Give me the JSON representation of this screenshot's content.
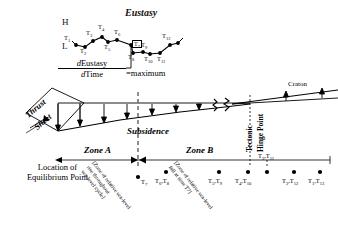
{
  "eustasy": {
    "title": "Eustasy",
    "high_label": "H",
    "low_label": "L",
    "formula_numerator": "dEustasy",
    "formula_denominator": "dTime",
    "formula_result": "=maximum",
    "boxed_point": "T7",
    "points": [
      {
        "label": "T1",
        "x": 76,
        "y": 45,
        "lx": 66,
        "ly": 39
      },
      {
        "label": "T2",
        "x": 85,
        "y": 47,
        "lx": 81,
        "ly": 50
      },
      {
        "label": "T3",
        "x": 93,
        "y": 41,
        "lx": 87,
        "ly": 34
      },
      {
        "label": "T4",
        "x": 102,
        "y": 37,
        "lx": 99,
        "ly": 28
      },
      {
        "label": "T5",
        "x": 108,
        "y": 42,
        "lx": 104,
        "ly": 48
      },
      {
        "label": "T6",
        "x": 117,
        "y": 40,
        "lx": 114,
        "ly": 33
      },
      {
        "label": "T7",
        "x": 131,
        "y": 45,
        "lx": 133,
        "ly": 35
      },
      {
        "label": "T8",
        "x": 133,
        "y": 53,
        "lx": 130,
        "ly": 57
      },
      {
        "label": "T9",
        "x": 143,
        "y": 52,
        "lx": 141,
        "ly": 45
      },
      {
        "label": "T10",
        "x": 150,
        "y": 54,
        "lx": 144,
        "ly": 58
      },
      {
        "label": "T11",
        "x": 160,
        "y": 53,
        "lx": 157,
        "ly": 58
      },
      {
        "label": "T12",
        "x": 170,
        "y": 45,
        "lx": 163,
        "ly": 38
      },
      {
        "label": "T13",
        "x": 178,
        "y": 43,
        "lx": 176,
        "ly": 36
      }
    ]
  },
  "cross_section": {
    "thrust_sheet_line1": "Thrust",
    "thrust_sheet_line2": "Sheet",
    "subsidence_label": "Subsidence",
    "craton_label": "Craton",
    "hinge_line1": "Tectonic",
    "hinge_line2": "Hinge Point"
  },
  "zones": {
    "zone_a": "Zone A",
    "zone_b": "Zone B",
    "note_a": "[Zone of relative sea-level rise throughout sea-level cycle]",
    "note_a_lines": [
      "[Zone of relative sea-level",
      "rise throughout",
      "sea-level cycle]"
    ],
    "note_b_lines": [
      "[Zone of relative sea-level",
      "fall at time T7]"
    ]
  },
  "equilibrium": {
    "line1": "Location of",
    "line2": "Equilibrium Point"
  },
  "bottom_points": [
    {
      "label": "T7",
      "sub1": "7",
      "x": 138,
      "y": 176,
      "has_dash": true,
      "lx": 141,
      "ly": 178
    },
    {
      "label": "T6,T8",
      "x": 166,
      "y": 172,
      "has_dash": false,
      "lx": 155,
      "ly": 177
    },
    {
      "label": "T5,T9",
      "x": 219,
      "y": 172,
      "has_dash": false,
      "lx": 209,
      "ly": 177
    },
    {
      "label": "T4,T10",
      "x": 248,
      "y": 172,
      "has_dash": false,
      "lx": 237,
      "ly": 177
    },
    {
      "label": "T3,T11",
      "x": 267,
      "y": 172,
      "has_dash": true,
      "lx": 258,
      "ly": 163
    },
    {
      "label": "T2,T12",
      "x": 294,
      "y": 172,
      "has_dash": false,
      "lx": 283,
      "ly": 177
    },
    {
      "label": "T1,T13",
      "x": 320,
      "y": 172,
      "has_dash": false,
      "lx": 309,
      "ly": 177
    }
  ],
  "colors": {
    "ink": "#000000",
    "background": "#ffffff",
    "dashed": "#555555"
  }
}
